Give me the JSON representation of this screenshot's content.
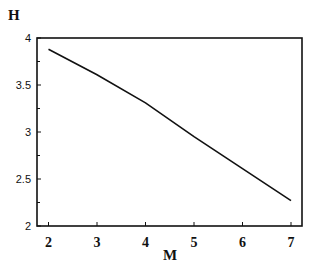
{
  "chart_data": {
    "type": "line",
    "title": "",
    "xlabel": "M",
    "ylabel": "H",
    "xlim": [
      2,
      7
    ],
    "ylim": [
      2,
      4
    ],
    "xticks": [
      2,
      3,
      4,
      5,
      6,
      7
    ],
    "yticks": [
      "2",
      "2.5",
      "3",
      "3.5",
      "4"
    ],
    "grid": false,
    "legend": null,
    "series": [
      {
        "name": "H(M)",
        "x": [
          2,
          3,
          4,
          5,
          6,
          7
        ],
        "y": [
          3.88,
          3.61,
          3.31,
          2.95,
          2.61,
          2.27
        ]
      }
    ]
  }
}
